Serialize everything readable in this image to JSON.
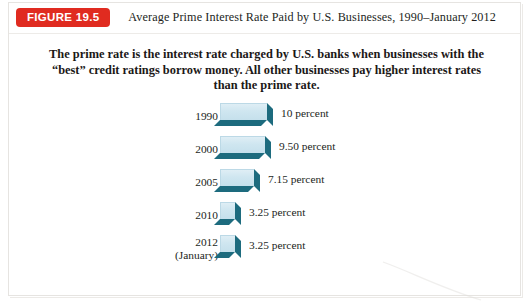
{
  "header": {
    "badge": "FIGURE 19.5",
    "title": "Average Prime Interest Rate Paid by U.S. Businesses, 1990–January 2012",
    "badge_color": "#e02b20",
    "badge_text_color": "#ffffff"
  },
  "caption": {
    "line1": "The prime rate is the interest rate charged by U.S. banks when businesses",
    "line2": "with the “best” credit ratings borrow money. All other businesses",
    "line3": "pay higher interest rates than the prime rate."
  },
  "chart_data": {
    "type": "bar",
    "orientation": "horizontal",
    "title": "Average Prime Interest Rate Paid by U.S. Businesses, 1990–January 2012",
    "xlabel": "",
    "ylabel": "",
    "grid": false,
    "legend": false,
    "xlim": [
      0,
      10
    ],
    "categories": [
      "1990",
      "2000",
      "2005",
      "2010",
      "2012 (January)"
    ],
    "values": [
      10,
      9.5,
      7.15,
      3.25,
      3.25
    ],
    "value_labels": [
      "10 percent",
      "9.50 percent",
      "7.15 percent",
      "3.25 percent",
      "3.25 percent"
    ],
    "bar_color": "#cfe6f0",
    "bar_shadow_color": "#1d6b7e"
  },
  "rows": [
    {
      "year": "1990",
      "year_sub": "",
      "value": 10,
      "value_label": "10 percent"
    },
    {
      "year": "2000",
      "year_sub": "",
      "value": 9.5,
      "value_label": "9.50 percent"
    },
    {
      "year": "2005",
      "year_sub": "",
      "value": 7.15,
      "value_label": "7.15 percent"
    },
    {
      "year": "2010",
      "year_sub": "",
      "value": 3.25,
      "value_label": "3.25 percent"
    },
    {
      "year": "2012",
      "year_sub": "(January)",
      "value": 3.25,
      "value_label": "3.25 percent"
    }
  ]
}
